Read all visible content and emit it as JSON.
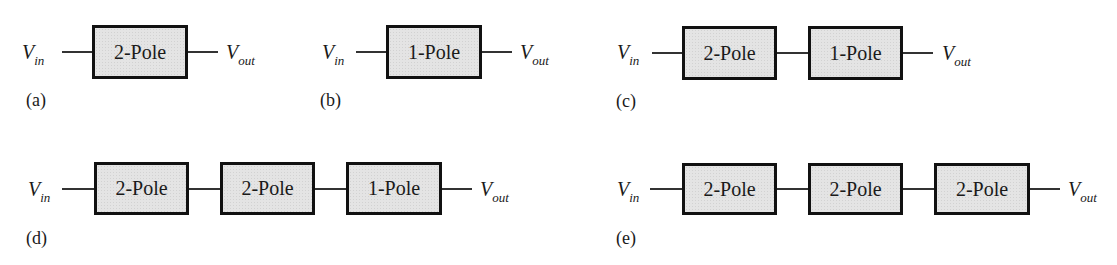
{
  "figure": {
    "input_label": {
      "main": "V",
      "sub": "in"
    },
    "output_label": {
      "main": "V",
      "sub": "out"
    },
    "colors": {
      "box_fill": "#e4e4e4",
      "box_border": "#111111",
      "wire": "#333333",
      "text": "#1a1a1a"
    },
    "panels": [
      {
        "id": "a",
        "caption": "(a)",
        "blocks": [
          "2-Pole"
        ]
      },
      {
        "id": "b",
        "caption": "(b)",
        "blocks": [
          "1-Pole"
        ]
      },
      {
        "id": "c",
        "caption": "(c)",
        "blocks": [
          "2-Pole",
          "1-Pole"
        ]
      },
      {
        "id": "d",
        "caption": "(d)",
        "blocks": [
          "2-Pole",
          "2-Pole",
          "1-Pole"
        ]
      },
      {
        "id": "e",
        "caption": "(e)",
        "blocks": [
          "2-Pole",
          "2-Pole",
          "2-Pole"
        ]
      }
    ]
  }
}
